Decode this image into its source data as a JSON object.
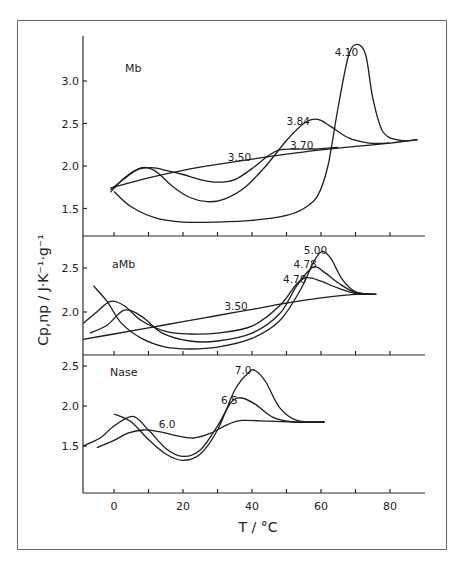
{
  "chart_data": {
    "type": "line",
    "title": "",
    "xlabel": "T / °C",
    "ylabel": "Cp,np / J·K⁻¹·g⁻¹",
    "xlim": [
      -10,
      90
    ],
    "x_ticks": [
      0,
      10,
      20,
      30,
      40,
      50,
      60,
      70,
      80
    ],
    "x_tick_labels": [
      "0",
      "20",
      "40",
      "60",
      "80"
    ],
    "grid": false,
    "legend": "none (curves labeled inline by pH)",
    "panels": [
      {
        "name": "Mb",
        "ylim": [
          1.2,
          3.45
        ],
        "y_ticks": [
          1.5,
          2.0,
          2.5,
          3.0
        ],
        "y_tick_labels": [
          "1.5",
          "2.0",
          "2.5",
          "3.0"
        ],
        "series": [
          {
            "name": "3.50",
            "label_pos": [
              33,
              2.06
            ],
            "x": [
              -1,
              10,
              20,
              30,
              40,
              50,
              60,
              70,
              80,
              88
            ],
            "y": [
              1.74,
              1.86,
              1.95,
              2.02,
              2.08,
              2.14,
              2.19,
              2.23,
              2.27,
              2.31
            ]
          },
          {
            "name": "3.70",
            "label_pos": [
              51,
              2.2
            ],
            "x": [
              -1,
              3,
              7,
              11,
              15,
              20,
              25,
              30,
              35,
              40,
              45,
              48,
              52,
              58,
              65
            ],
            "y": [
              1.72,
              1.85,
              1.96,
              1.98,
              1.95,
              1.9,
              1.84,
              1.81,
              1.84,
              1.97,
              2.13,
              2.19,
              2.2,
              2.2,
              2.22
            ]
          },
          {
            "name": "3.84",
            "label_pos": [
              50,
              2.48
            ],
            "x": [
              -1,
              3,
              8,
              12,
              17,
              22,
              27,
              32,
              38,
              44,
              50,
              55,
              59,
              63,
              68,
              74,
              80
            ],
            "y": [
              1.69,
              1.86,
              1.98,
              1.94,
              1.76,
              1.63,
              1.58,
              1.61,
              1.75,
              2.0,
              2.3,
              2.5,
              2.55,
              2.46,
              2.33,
              2.27,
              2.27
            ]
          },
          {
            "name": "4.10",
            "label_pos": [
              64,
              3.3
            ],
            "x": [
              0,
              5,
              12,
              20,
              30,
              40,
              50,
              55,
              59,
              62,
              65,
              68,
              70.5,
              73,
              75,
              78,
              83,
              88
            ],
            "y": [
              1.7,
              1.52,
              1.39,
              1.34,
              1.34,
              1.36,
              1.42,
              1.5,
              1.65,
              2.0,
              2.7,
              3.3,
              3.43,
              3.3,
              2.8,
              2.4,
              2.3,
              2.31
            ]
          }
        ]
      },
      {
        "name": "aMb",
        "ylim": [
          1.5,
          2.75
        ],
        "y_ticks": [
          2.0,
          2.5
        ],
        "y_tick_labels": [
          "2.0",
          "2.5"
        ],
        "series": [
          {
            "name": "3.50",
            "label_pos": [
              32,
              2.02
            ],
            "x": [
              -9,
              0,
              10,
              20,
              30,
              40,
              50,
              60,
              70,
              76
            ],
            "y": [
              1.69,
              1.75,
              1.82,
              1.89,
              1.96,
              2.03,
              2.1,
              2.16,
              2.2,
              2.2
            ]
          },
          {
            "name": "4.70",
            "label_pos": [
              49,
              2.33
            ],
            "x": [
              -9,
              -5,
              -1,
              3,
              8,
              15,
              22,
              30,
              40,
              48,
              53,
              56,
              60,
              65,
              70,
              76
            ],
            "y": [
              1.87,
              2.0,
              2.12,
              2.07,
              1.9,
              1.78,
              1.75,
              1.76,
              1.84,
              2.07,
              2.32,
              2.39,
              2.35,
              2.27,
              2.21,
              2.2
            ]
          },
          {
            "name": "4.78",
            "label_pos": [
              52,
              2.5
            ],
            "x": [
              -7,
              -2,
              3,
              8,
              14,
              22,
              30,
              40,
              48,
              53,
              57.7,
              61,
              65,
              70,
              76
            ],
            "y": [
              1.76,
              1.85,
              2.02,
              1.95,
              1.76,
              1.67,
              1.67,
              1.76,
              1.98,
              2.3,
              2.51,
              2.45,
              2.33,
              2.22,
              2.2
            ]
          },
          {
            "name": "5.00",
            "label_pos": [
              55,
              2.66
            ],
            "x": [
              -6,
              -2,
              2,
              8,
              15,
              22,
              30,
              40,
              48,
              54,
              58,
              60.5,
              63,
              66,
              70,
              76
            ],
            "y": [
              2.3,
              2.12,
              1.88,
              1.7,
              1.6,
              1.58,
              1.6,
              1.7,
              1.9,
              2.25,
              2.58,
              2.69,
              2.6,
              2.38,
              2.23,
              2.2
            ]
          }
        ]
      },
      {
        "name": "Nase",
        "ylim": [
          1.0,
          2.65
        ],
        "y_ticks": [
          1.5,
          2.0,
          2.5
        ],
        "y_tick_labels": [
          "1.5",
          "2.0",
          "2.5"
        ],
        "series": [
          {
            "name": "6.0",
            "label_pos": [
              13,
              1.73
            ],
            "x": [
              -5,
              0,
              4,
              8.5,
              13,
              18,
              23,
              28,
              33,
              37,
              45,
              53,
              61
            ],
            "y": [
              1.48,
              1.57,
              1.66,
              1.7,
              1.68,
              1.63,
              1.6,
              1.66,
              1.77,
              1.82,
              1.81,
              1.8,
              1.8
            ]
          },
          {
            "name": "6.5",
            "label_pos": [
              31,
              2.02
            ],
            "x": [
              -9,
              -4,
              0,
              5.5,
              10,
              15,
              20,
              25,
              30,
              34,
              37,
              41,
              46,
              52,
              61
            ],
            "y": [
              1.5,
              1.6,
              1.75,
              1.87,
              1.7,
              1.47,
              1.37,
              1.45,
              1.75,
              2.05,
              2.1,
              2.02,
              1.86,
              1.8,
              1.8
            ]
          },
          {
            "name": "7.0",
            "label_pos": [
              35,
              2.4
            ],
            "x": [
              0,
              5,
              10,
              15,
              20,
              25,
              30,
              35,
              39,
              41,
              44,
              48,
              53,
              61
            ],
            "y": [
              1.9,
              1.8,
              1.58,
              1.4,
              1.32,
              1.4,
              1.7,
              2.2,
              2.42,
              2.44,
              2.3,
              1.98,
              1.82,
              1.8
            ]
          }
        ]
      }
    ]
  }
}
